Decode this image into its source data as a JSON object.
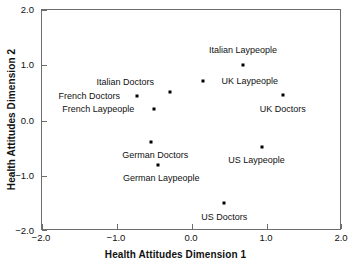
{
  "chart_data": {
    "type": "scatter",
    "title": "",
    "xlabel": "Health Attitudes Dimension 1",
    "ylabel": "Health Attitudes Dimension 2",
    "xlim": [
      -2.0,
      2.0
    ],
    "ylim": [
      -2.0,
      2.0
    ],
    "xticks": [
      "-2.0",
      "-1.0",
      "0.0",
      "1.0",
      "2.0"
    ],
    "xtick_values": [
      -2.0,
      -1.0,
      0.0,
      1.0,
      2.0
    ],
    "yticks": [
      "-2.0",
      "-1.0",
      "0.0",
      "1.0",
      "2.0"
    ],
    "ytick_values": [
      -2.0,
      -1.0,
      0.0,
      1.0,
      2.0
    ],
    "grid": false,
    "legend": "none",
    "marker": "filled-square",
    "marker_color": "#000000",
    "points": [
      {
        "label": "Italian Laypeople",
        "x": 0.68,
        "y": 1.0,
        "label_dx": 0.0,
        "label_dy": 0.28
      },
      {
        "label": "UK Laypeople",
        "x": 0.15,
        "y": 0.71,
        "label_dx": 0.62,
        "label_dy": 0.0
      },
      {
        "label": "UK Doctors",
        "x": 1.21,
        "y": 0.46,
        "label_dx": 0.0,
        "label_dy": -0.25
      },
      {
        "label": "Italian Doctors",
        "x": -0.29,
        "y": 0.52,
        "label_dx": -0.6,
        "label_dy": 0.17
      },
      {
        "label": "French Doctors",
        "x": -0.73,
        "y": 0.44,
        "label_dx": -0.64,
        "label_dy": 0.0
      },
      {
        "label": "French Laypeople",
        "x": -0.51,
        "y": 0.21,
        "label_dx": -0.74,
        "label_dy": 0.0
      },
      {
        "label": "German Doctors",
        "x": -0.55,
        "y": -0.39,
        "label_dx": 0.06,
        "label_dy": -0.23
      },
      {
        "label": "German Laypeople",
        "x": -0.45,
        "y": -0.81,
        "label_dx": 0.04,
        "label_dy": -0.23
      },
      {
        "label": "US Laypeople",
        "x": 0.93,
        "y": -0.48,
        "label_dx": -0.07,
        "label_dy": -0.24
      },
      {
        "label": "US Doctors",
        "x": 0.43,
        "y": -1.49,
        "label_dx": 0.0,
        "label_dy": -0.25
      }
    ]
  }
}
